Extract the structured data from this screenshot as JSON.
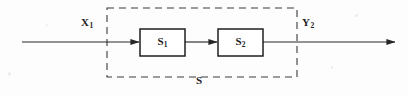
{
  "diagram": {
    "type": "block-diagram",
    "background_color": "#fdfdfd",
    "line_color": "#333333",
    "labels": {
      "input": {
        "base": "X",
        "subscript": "1",
        "full": "X₁"
      },
      "output": {
        "base": "Y",
        "subscript": "2",
        "full": "Y₂"
      },
      "system": {
        "base": "S",
        "subscript": "",
        "full": "S"
      }
    },
    "blocks": [
      {
        "name": "block-s1",
        "base": "S",
        "subscript": "1",
        "full": "S₁",
        "x": 140,
        "y": 29,
        "width": 45,
        "height": 27
      },
      {
        "name": "block-s2",
        "base": "S",
        "subscript": "2",
        "full": "S₂",
        "x": 218,
        "y": 29,
        "width": 45,
        "height": 27
      }
    ],
    "enclosure": {
      "name": "dashed-system-boundary",
      "x": 107,
      "y": 8,
      "width": 190,
      "height": 69,
      "style": "dashed"
    },
    "signal_line_y": 42,
    "arrows": [
      {
        "name": "input-arrow",
        "from_x": 22,
        "to_x": 140
      },
      {
        "name": "interstage-arrow",
        "from_x": 185,
        "to_x": 218
      },
      {
        "name": "output-arrow",
        "from_x": 263,
        "to_x": 396
      }
    ]
  }
}
